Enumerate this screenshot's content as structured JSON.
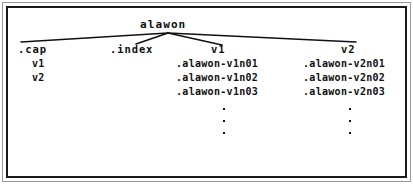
{
  "diagram": {
    "type": "tree",
    "root": {
      "label": "alawon"
    },
    "branches": [
      {
        "id": "cap",
        "label": ".cap",
        "children": [
          "v1",
          "v2"
        ]
      },
      {
        "id": "index",
        "label": ".index",
        "children": []
      },
      {
        "id": "v1",
        "label": "v1",
        "children": [
          ".alawon-v1n01",
          ".alawon-v1n02",
          ".alawon-v1n03"
        ],
        "continuation": "vertical-ellipsis"
      },
      {
        "id": "v2",
        "label": "v2",
        "children": [
          ".alawon-v2n01",
          ".alawon-v2n02",
          ".alawon-v2n03"
        ],
        "continuation": "vertical-ellipsis"
      }
    ],
    "ellipsis_dot_count": 3,
    "colors": {
      "line": "#111111",
      "text": "#111111",
      "border_inner": "#1a1a1a",
      "border_outer": "#9a9a9a",
      "background": "#ffffff"
    }
  }
}
